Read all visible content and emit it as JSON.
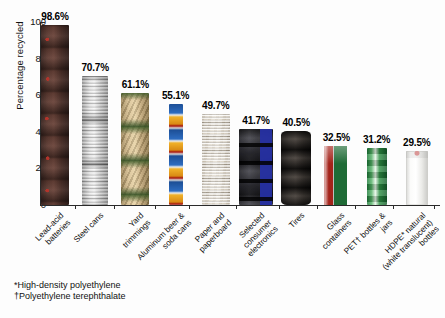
{
  "chart_data": {
    "type": "bar",
    "title": "",
    "xlabel": "",
    "ylabel": "Percentage recycled",
    "ylim": [
      0,
      105
    ],
    "yticks": [
      0,
      20,
      40,
      60,
      80,
      100
    ],
    "grid": false,
    "legend": null,
    "value_suffix": "%",
    "categories": [
      "Lead-acid\nbatteries",
      "Steel cans",
      "Yard\ntrimmings",
      "Aluminum beer &\nsoda cans",
      "Paper and\npaperboard",
      "Selected\nconsumer\nelectronics",
      "Tires",
      "Glass\ncontainers",
      "PET† bottles &\njars",
      "HDPE* natural\n(white translucent)\nbottles"
    ],
    "values": [
      98.6,
      70.7,
      61.1,
      55.1,
      49.7,
      41.7,
      40.5,
      32.5,
      31.2,
      29.5
    ],
    "value_labels": [
      "98.6%",
      "70.7%",
      "61.1%",
      "55.1%",
      "49.7%",
      "41.7%",
      "40.5%",
      "32.5%",
      "31.2%",
      "29.5%"
    ],
    "bar_textures": [
      "tex-battery",
      "tex-steel",
      "tex-yard",
      "tex-alum",
      "tex-paper",
      "tex-elec",
      "tex-tire",
      "tex-glass",
      "tex-pet",
      "tex-hdpe"
    ],
    "bar_semantic_names": [
      "bar-lead-acid-batteries",
      "bar-steel-cans",
      "bar-yard-trimmings",
      "bar-aluminum-cans",
      "bar-paper-paperboard",
      "bar-consumer-electronics",
      "bar-tires",
      "bar-glass-containers",
      "bar-pet-bottles",
      "bar-hdpe-bottles"
    ],
    "bar_widths": [
      28,
      26,
      28,
      14,
      28,
      34,
      30,
      26,
      20,
      22
    ]
  },
  "footnotes": [
    "*High-density polyethylene",
    "†Polyethylene terephthalate"
  ],
  "colors": {
    "axis": "#2a2a2a",
    "text": "#111111",
    "background": "#fdfdfd"
  }
}
